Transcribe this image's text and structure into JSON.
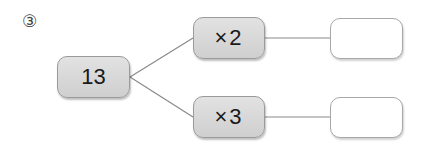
{
  "problem": {
    "number_label": "③",
    "start_value": "13",
    "branches": [
      {
        "operation": "×2",
        "result": ""
      },
      {
        "operation": "×3",
        "result": ""
      }
    ]
  },
  "colors": {
    "box_fill": "#d9d9d9",
    "box_border": "#9a9a9a",
    "line": "#8a8a8a"
  }
}
